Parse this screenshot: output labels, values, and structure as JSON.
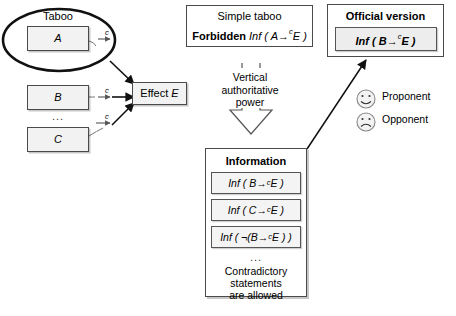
{
  "diagram": {
    "left_group": {
      "ellipse_label": "Taboo",
      "box_a": "A",
      "box_b": "B",
      "box_c": "C",
      "ellipsis": "...",
      "cause_marker": "c",
      "effect_box": "Effect E"
    },
    "simple_taboo": {
      "line1": "Simple taboo",
      "forbidden_label": "Forbidden",
      "formula_prefix": "Inf ( A",
      "formula_arrow": "→",
      "formula_sup": "c",
      "formula_suffix": "E )"
    },
    "official_version": {
      "title": "Official version",
      "formula_prefix": "Inf ( B",
      "formula_arrow": "→",
      "formula_sup": "c",
      "formula_suffix": "E )"
    },
    "vertical_power": {
      "line1": "Vertical",
      "line2": "authoritative",
      "line3": "power"
    },
    "information": {
      "title": "Information",
      "items": [
        {
          "prefix": "Inf ( B",
          "arrow": "→",
          "sup": "c",
          "suffix": "E )"
        },
        {
          "prefix": "Inf ( C",
          "arrow": "→",
          "sup": "c",
          "suffix": "E )"
        },
        {
          "prefix": "Inf ( ¬(B",
          "arrow": "→",
          "sup": "c",
          "suffix": "E ) )"
        }
      ],
      "ellipsis": "...",
      "note_line1": "Contradictory statements",
      "note_line2": "are allowed"
    },
    "legend": {
      "proponent_label": "Proponent",
      "opponent_label": "Opponent"
    },
    "colors": {
      "box_fill": "#f2f2f2",
      "box_stroke": "#4a4a4a",
      "page_bg": "#ffffff",
      "arrow": "#111111",
      "thin_arrow": "#555555"
    }
  }
}
